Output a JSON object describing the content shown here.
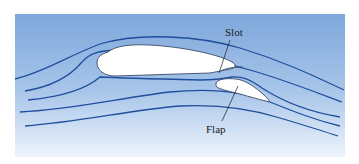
{
  "diagram": {
    "labels": {
      "slot": "Slot",
      "flap": "Flap"
    },
    "colors": {
      "background_top": "#7ea7db",
      "background_bottom": "#eef4fb",
      "streamline": "#1f4f9c",
      "airfoil_fill": "#ffffff",
      "airfoil_stroke": "#3a4a66",
      "leader_line": "#1a1a1a"
    }
  }
}
